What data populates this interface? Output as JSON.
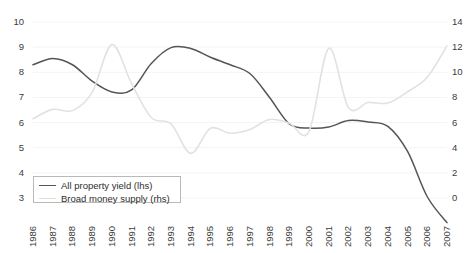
{
  "chart_data": {
    "type": "line",
    "title": "",
    "subtitle": "",
    "xlabel": "",
    "ylabel": "",
    "grid": true,
    "legend_position": "bottom-left",
    "x": [
      1986,
      1987,
      1988,
      1989,
      1990,
      1991,
      1992,
      1993,
      1994,
      1995,
      1996,
      1997,
      1998,
      1999,
      2000,
      2001,
      2002,
      2003,
      2004,
      2005,
      2006,
      2007
    ],
    "xtick_labels": [
      "1986",
      "1987",
      "1988",
      "1989",
      "1990",
      "1991",
      "1992",
      "1993",
      "1994",
      "1995",
      "1996",
      "1997",
      "1998",
      "1999",
      "2000",
      "2001",
      "2002",
      "2003",
      "2004",
      "2005",
      "2006",
      "2007"
    ],
    "left_axis": {
      "label": "",
      "ylim": [
        3,
        10
      ],
      "ticks": [
        3,
        4,
        5,
        6,
        7,
        8,
        9,
        10
      ],
      "tick_labels": [
        "3",
        "4",
        "5",
        "6",
        "7",
        "8",
        "9",
        "10"
      ]
    },
    "right_axis": {
      "label": "",
      "ylim": [
        0,
        14
      ],
      "ticks": [
        0,
        2,
        4,
        6,
        8,
        10,
        12,
        14
      ],
      "tick_labels": [
        "0",
        "2",
        "4",
        "6",
        "8",
        "10",
        "12",
        "14"
      ]
    },
    "series": [
      {
        "name": "All property yield (lhs)",
        "axis": "left",
        "color": "#555555",
        "width": 1.5,
        "values": [
          8.3,
          8.55,
          8.3,
          7.65,
          7.22,
          7.3,
          8.35,
          8.98,
          8.95,
          8.6,
          8.3,
          7.95,
          7.0,
          5.95,
          5.78,
          5.82,
          6.08,
          6.02,
          5.85,
          4.85,
          3.05,
          2.02
        ]
      },
      {
        "name": "Broad money supply (rhs)",
        "axis": "right",
        "color": "#e2e2e2",
        "width": 1.6,
        "values": [
          6.3,
          7.05,
          6.95,
          8.4,
          12.2,
          9.1,
          6.4,
          5.9,
          3.55,
          5.55,
          5.15,
          5.45,
          6.25,
          5.95,
          5.3,
          11.9,
          7.2,
          7.6,
          7.55,
          8.45,
          9.6,
          12.1
        ]
      }
    ]
  },
  "legend": {
    "entries": [
      {
        "label": "All property yield (lhs)",
        "color": "#555555"
      },
      {
        "label": "Broad money supply (rhs)",
        "color": "#dcdcdc"
      }
    ]
  },
  "style": {
    "background": "#ffffff",
    "grid_color": "#f4f4f4",
    "text_color": "#3b3b3b",
    "legend_border": "#b9b9b9"
  }
}
